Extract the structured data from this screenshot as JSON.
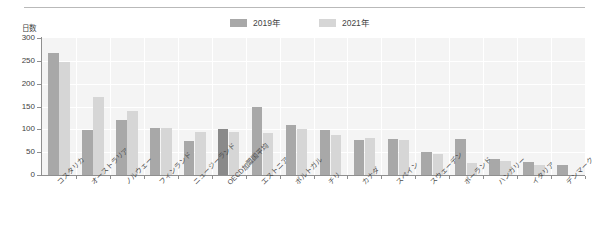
{
  "chart_data": {
    "type": "bar",
    "title": "",
    "subtitle": "",
    "xlabel": "",
    "ylabel": "日数",
    "ylim": [
      0,
      300
    ],
    "ytick_step": 50,
    "yticks": [
      "300",
      "250",
      "200",
      "150",
      "100",
      "50",
      "0"
    ],
    "grid": true,
    "legend_position": "top-center",
    "categories": [
      "コスタリカ",
      "オーストラリア",
      "ノルウェー",
      "フィンランド",
      "ニュージーランド",
      "OECD加盟国平均",
      "エストニア",
      "ポルトガル",
      "チリ",
      "カナダ",
      "スペイン",
      "スウェーデン",
      "ポーランド",
      "ハンガリー",
      "イタリア",
      "デンマーク"
    ],
    "series": [
      {
        "name": "2019年",
        "color": "#a8a8a8",
        "values": [
          267,
          99,
          120,
          104,
          74,
          100,
          148,
          110,
          99,
          76,
          79,
          50,
          79,
          35,
          29,
          22
        ]
      },
      {
        "name": "2021年",
        "color": "#d6d6d6",
        "values": [
          247,
          171,
          140,
          104,
          95,
          95,
          93,
          100,
          88,
          80,
          76,
          47,
          27,
          30,
          22,
          0
        ]
      }
    ],
    "highlight_category": "OECD加盟国平均",
    "highlight_color": "#8a8a8a"
  },
  "legend": {
    "entries": [
      {
        "label": "2019年",
        "color": "#a8a8a8"
      },
      {
        "label": "2021年",
        "color": "#d6d6d6"
      }
    ]
  },
  "axes": {
    "y_unit_label": "日数"
  }
}
